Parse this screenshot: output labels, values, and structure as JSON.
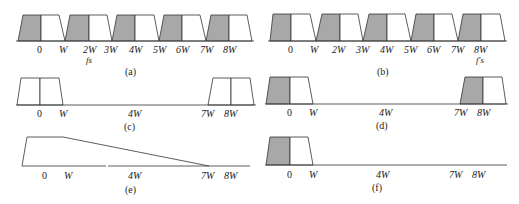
{
  "figure": {
    "colors": {
      "shade": "#a8a8a8",
      "line": "#333333",
      "bg": "#ffffff"
    },
    "panels": [
      {
        "id": "a",
        "caption": "(a)",
        "ticks": [
          "0",
          "W",
          "2W",
          "3W",
          "4W",
          "5W",
          "6W",
          "7W",
          "8W"
        ],
        "sub_label": "fs",
        "sub_under": "2W",
        "description": "Spectrum sampled at fs = 2W; replicas of trapezoidal spectrum, lower half shaded"
      },
      {
        "id": "b",
        "caption": "(b)",
        "ticks": [
          "0",
          "W",
          "2W",
          "3W",
          "4W",
          "5W",
          "6W",
          "7W",
          "8W"
        ],
        "sub_label": "f's",
        "sub_under": "8W",
        "description": "Replicated spectra with shaded halves, f's marked at 8W"
      },
      {
        "id": "c",
        "caption": "(c)",
        "ticks": [
          "0",
          "W",
          "4W",
          "7W",
          "8W"
        ],
        "description": "Two unshaded trapezoidal spectra centered at 0 and 8W"
      },
      {
        "id": "d",
        "caption": "(d)",
        "ticks": [
          "0",
          "W",
          "4W",
          "7W",
          "8W"
        ],
        "description": "Two trapezoidal spectra centered at 0 and 8W with left halves shaded"
      },
      {
        "id": "e",
        "caption": "(e)",
        "ticks": [
          "0",
          "W",
          "4W",
          "7W",
          "8W"
        ],
        "description": "Filter response: flat to W then sloping down to zero at 7W"
      },
      {
        "id": "f",
        "caption": "(f)",
        "ticks": [
          "0",
          "W",
          "4W",
          "7W",
          "8W"
        ],
        "description": "Single recovered spectrum centered at 0 with left half shaded"
      }
    ]
  }
}
